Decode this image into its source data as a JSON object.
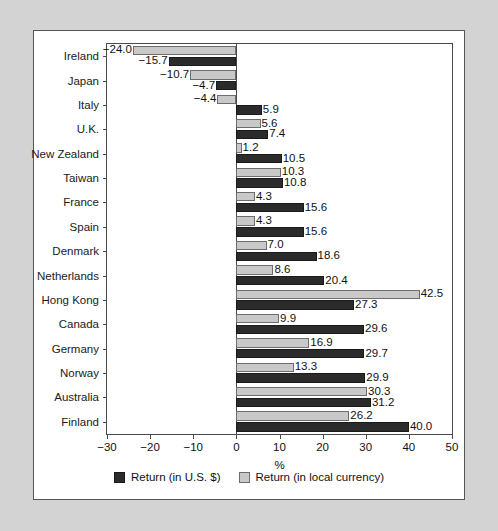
{
  "chart_data": {
    "type": "bar",
    "orientation": "horizontal",
    "title": "",
    "xlabel": "%",
    "ylabel": "",
    "xlim": [
      -30,
      50
    ],
    "xticks": [
      -30,
      -20,
      -10,
      0,
      10,
      20,
      30,
      40,
      50
    ],
    "xtick_labels": [
      "−30",
      "−20",
      "−10",
      "0",
      "10",
      "20",
      "30",
      "40",
      "50"
    ],
    "grid": false,
    "legend_position": "bottom",
    "categories": [
      "Ireland",
      "Japan",
      "Italy",
      "U.K.",
      "New Zealand",
      "Taiwan",
      "France",
      "Spain",
      "Denmark",
      "Netherlands",
      "Hong Kong",
      "Canada",
      "Germany",
      "Norway",
      "Australia",
      "Finland"
    ],
    "series": [
      {
        "name": "Return (in local currency)",
        "key": "local",
        "color": "#c9c9c9",
        "values": [
          -24.0,
          -10.7,
          -4.4,
          5.6,
          1.2,
          10.3,
          4.3,
          4.3,
          7.0,
          8.6,
          42.5,
          9.9,
          16.9,
          13.3,
          30.3,
          26.2
        ],
        "labels": [
          "−24.0",
          "−10.7",
          "−4.4",
          "5.6",
          "1.2",
          "10.3",
          "4.3",
          "4.3",
          "7.0",
          "8.6",
          "42.5",
          "9.9",
          "16.9",
          "13.3",
          "30.3",
          "26.2"
        ]
      },
      {
        "name": "Return (in U.S. $)",
        "key": "usd",
        "color": "#2b2b2b",
        "values": [
          -15.7,
          -4.7,
          5.9,
          7.4,
          10.5,
          10.8,
          15.6,
          15.6,
          18.6,
          20.4,
          27.3,
          29.6,
          29.7,
          29.9,
          31.2,
          40.0
        ],
        "labels": [
          "−15.7",
          "−4.7",
          "5.9",
          "7.4",
          "10.5",
          "10.8",
          "15.6",
          "15.6",
          "18.6",
          "20.4",
          "27.3",
          "29.6",
          "29.7",
          "29.9",
          "31.2",
          "40.0"
        ]
      }
    ],
    "legend": [
      {
        "label": "Return (in U.S. $)",
        "color": "#2b2b2b",
        "style": "dark"
      },
      {
        "label": "Return (in local currency)",
        "color": "#c9c9c9",
        "style": "light"
      }
    ]
  }
}
